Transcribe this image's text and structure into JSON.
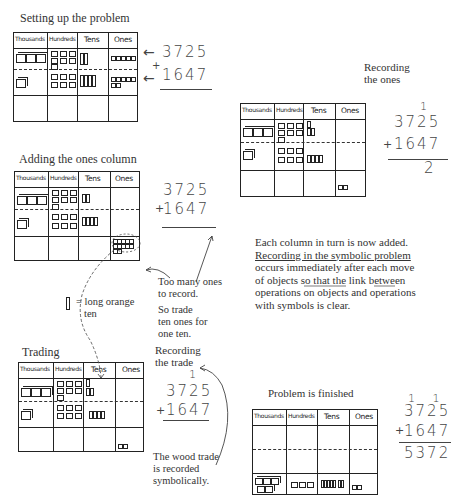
{
  "headers": [
    "Thousands",
    "Hundreds",
    "Tens",
    "Ones"
  ],
  "problem": {
    "addend1": "3725",
    "addend2": "1647",
    "operator": "+"
  },
  "panels": {
    "setup": {
      "title": "Setting up the problem",
      "arrow1": "←",
      "arrow2": "←"
    },
    "ones": {
      "title": "Recording the ones",
      "carry": "1",
      "result": "2"
    },
    "adding": {
      "title": "Adding the ones column",
      "note_lines": [
        "Too many ones",
        "to record.",
        "So trade",
        "ten ones for",
        "one ten."
      ]
    },
    "legend": {
      "icon": "long-orange-ten",
      "text_lines": [
        "= long orange",
        "ten"
      ]
    },
    "trading": {
      "title": "Trading",
      "rec_title_lines": [
        "Recording",
        "the trade"
      ],
      "carry": "1",
      "note_lines": [
        "The wood trade",
        "is recorded",
        "symbolically."
      ]
    },
    "explanation": {
      "lines": [
        "Each column in turn is now added.",
        "Recording in the symbolic problem",
        "occurs immediately after each move",
        "of objects so that the link between",
        "operations on objects and operations",
        "with symbols is clear."
      ]
    },
    "finished": {
      "title": "Problem is finished",
      "carries": "1 1",
      "result": "5372"
    }
  }
}
